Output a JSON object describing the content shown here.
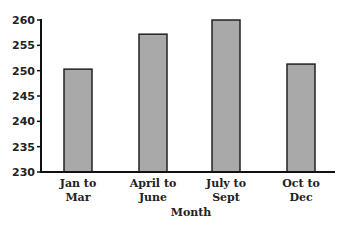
{
  "chart_data": {
    "type": "bar",
    "title": "",
    "xlabel": "Month",
    "ylabel": "",
    "categories": [
      "Jan to Mar",
      "April to June",
      "July to Sept",
      "Oct to Dec"
    ],
    "category_lines": [
      [
        "Jan to",
        "Mar"
      ],
      [
        "April to",
        "June"
      ],
      [
        "July to",
        "Sept"
      ],
      [
        "Oct to",
        "Dec"
      ]
    ],
    "values": [
      250.3,
      257.2,
      260,
      251.3
    ],
    "ylim": [
      230,
      260
    ],
    "yticks": [
      230,
      235,
      240,
      245,
      250,
      255,
      260
    ],
    "grid": false,
    "legend": null,
    "colors": {
      "bar_fill": "#a9a9a9",
      "bar_stroke": "#222222",
      "axis": "#111111"
    }
  }
}
